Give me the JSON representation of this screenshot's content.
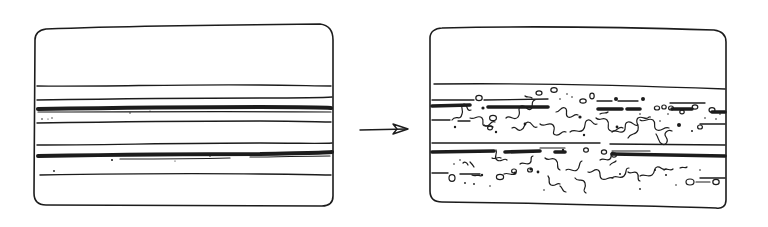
{
  "figure": {
    "ink_color": "#1c1c1c",
    "background_color": "#ffffff"
  },
  "panels": [
    {
      "id": "before",
      "label": "Intact layered structure",
      "layers": [
        {
          "type": "thin",
          "y": 86
        },
        {
          "type": "thin",
          "y": 99
        },
        {
          "type": "thick",
          "y": 108
        },
        {
          "type": "thin",
          "y": 122
        },
        {
          "type": "thin",
          "y": 145
        },
        {
          "type": "thick",
          "y": 156
        },
        {
          "type": "thin",
          "y": 175
        }
      ]
    },
    {
      "id": "after",
      "label": "Fragmented layered structure",
      "layers": [
        {
          "type": "thin",
          "y": 85
        },
        {
          "type": "thick-broken",
          "y": 103
        },
        {
          "type": "thin-broken",
          "y": 121
        },
        {
          "type": "thin",
          "y": 144
        },
        {
          "type": "thick-broken",
          "y": 153
        },
        {
          "type": "thin-broken",
          "y": 174
        }
      ]
    }
  ],
  "arrow": {
    "label": "transforms into",
    "direction": "right"
  }
}
